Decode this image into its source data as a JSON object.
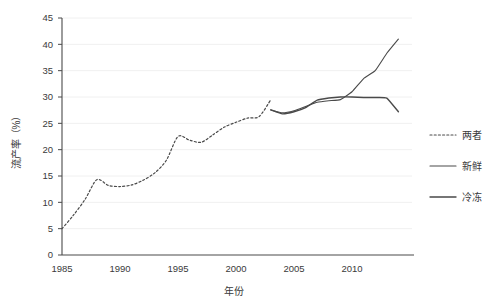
{
  "chart_data": {
    "type": "line",
    "title": "",
    "xlabel": "年份",
    "ylabel": "流产率（%）",
    "xlim": [
      1985,
      2015
    ],
    "ylim": [
      0,
      45
    ],
    "x_ticks": [
      1985,
      1990,
      1995,
      2000,
      2005,
      2010
    ],
    "x_tick_labels": [
      "1985",
      "1990",
      "1995",
      "2000",
      "2005",
      "2010"
    ],
    "y_ticks": [
      0,
      5,
      10,
      15,
      20,
      25,
      30,
      35,
      40,
      45
    ],
    "y_tick_labels": [
      "0",
      "5",
      "10",
      "15",
      "20",
      "25",
      "30",
      "35",
      "40",
      "45"
    ],
    "grid": "horizontal",
    "legend_position": "right",
    "series": [
      {
        "name": "两者",
        "style": "dashed",
        "color": "#4a4a4a",
        "x": [
          1985,
          1986,
          1987,
          1988,
          1989,
          1990,
          1991,
          1992,
          1993,
          1994,
          1995,
          1996,
          1997,
          1998,
          1999,
          2000,
          2001,
          2002
        ],
        "values": [
          5.0,
          7.6,
          10.6,
          14.3,
          13.2,
          13.0,
          13.3,
          14.2,
          15.6,
          18.0,
          22.5,
          21.8,
          21.4,
          22.8,
          24.3,
          25.2,
          26.0,
          26.3
        ]
      },
      {
        "name": "新鲜",
        "style": "solid",
        "color": "#4a4a4a",
        "x": [
          2003,
          2004,
          2005,
          2006,
          2007,
          2008,
          2009,
          2010,
          2011,
          2012,
          2013,
          2014
        ],
        "values": [
          27.5,
          27.0,
          27.4,
          28.2,
          29.0,
          29.3,
          29.5,
          31.0,
          33.5,
          35.0,
          38.3,
          41.0
        ]
      },
      {
        "name": "冷冻",
        "style": "solid",
        "color": "#4a4a4a",
        "x": [
          2003,
          2004,
          2005,
          2006,
          2007,
          2008,
          2009,
          2010,
          2011,
          2012,
          2013,
          2014
        ],
        "values": [
          27.6,
          26.8,
          27.2,
          28.0,
          29.4,
          29.8,
          30.0,
          30.0,
          29.9,
          29.9,
          29.8,
          27.2
        ]
      }
    ],
    "dashed_extension": {
      "x": [
        2002,
        2003
      ],
      "values": [
        26.3,
        29.5
      ]
    }
  },
  "legend": {
    "items": [
      {
        "label": "两者",
        "style": "dashed"
      },
      {
        "label": "新鲜",
        "style": "solid"
      },
      {
        "label": "冷冻",
        "style": "solid"
      }
    ]
  },
  "axes": {
    "x_title": "年份",
    "y_title": "流产率（%）"
  }
}
